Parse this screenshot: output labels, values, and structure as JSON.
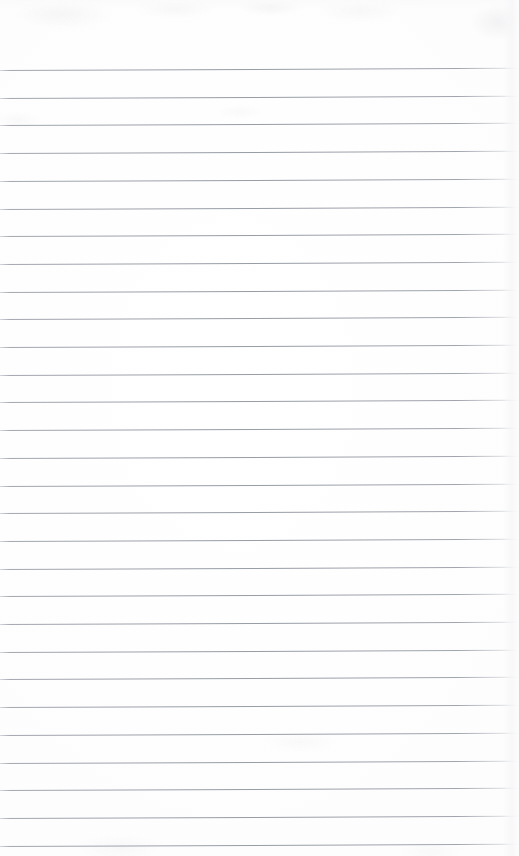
{
  "document": {
    "kind": "scanned-lined-notepad-page",
    "title": "Lined Notepad Page",
    "content_text": "",
    "is_blank": true,
    "width_px": 519,
    "height_px": 856
  },
  "paper": {
    "background_color": "#fdfdfd",
    "edge_tint_color": "#f6f6f8",
    "texture_visible": true
  },
  "ruling": {
    "line_color": "#969ba4",
    "line_color_light": "#b2b6bd",
    "line_thickness_px": 1,
    "line_spacing_px": 27.7,
    "first_line_y_px": 70,
    "last_line_y_px": 838,
    "line_count": 28,
    "left_inset_px": 0,
    "right_inset_px": 0,
    "skew_rise_px": -2.2,
    "top_margin_px": 70,
    "bottom_margin_px": 18,
    "margin_rule_visible": false,
    "holes_visible": false
  },
  "lines": [
    {
      "index": 1,
      "y": 70.0,
      "text": ""
    },
    {
      "index": 2,
      "y": 97.7,
      "text": ""
    },
    {
      "index": 3,
      "y": 125.4,
      "text": ""
    },
    {
      "index": 4,
      "y": 153.1,
      "text": ""
    },
    {
      "index": 5,
      "y": 180.8,
      "text": ""
    },
    {
      "index": 6,
      "y": 208.5,
      "text": ""
    },
    {
      "index": 7,
      "y": 236.2,
      "text": ""
    },
    {
      "index": 8,
      "y": 263.9,
      "text": ""
    },
    {
      "index": 9,
      "y": 291.6,
      "text": ""
    },
    {
      "index": 10,
      "y": 319.3,
      "text": ""
    },
    {
      "index": 11,
      "y": 347.0,
      "text": ""
    },
    {
      "index": 12,
      "y": 374.7,
      "text": ""
    },
    {
      "index": 13,
      "y": 402.4,
      "text": ""
    },
    {
      "index": 14,
      "y": 430.1,
      "text": ""
    },
    {
      "index": 15,
      "y": 457.8,
      "text": ""
    },
    {
      "index": 16,
      "y": 485.5,
      "text": ""
    },
    {
      "index": 17,
      "y": 513.2,
      "text": ""
    },
    {
      "index": 18,
      "y": 540.9,
      "text": ""
    },
    {
      "index": 19,
      "y": 568.6,
      "text": ""
    },
    {
      "index": 20,
      "y": 596.3,
      "text": ""
    },
    {
      "index": 21,
      "y": 624.0,
      "text": ""
    },
    {
      "index": 22,
      "y": 651.7,
      "text": ""
    },
    {
      "index": 23,
      "y": 679.4,
      "text": ""
    },
    {
      "index": 24,
      "y": 707.1,
      "text": ""
    },
    {
      "index": 25,
      "y": 734.8,
      "text": ""
    },
    {
      "index": 26,
      "y": 762.5,
      "text": ""
    },
    {
      "index": 27,
      "y": 790.2,
      "text": ""
    },
    {
      "index": 28,
      "y": 817.9,
      "text": ""
    },
    {
      "index": 29,
      "y": 845.6,
      "text": ""
    }
  ]
}
